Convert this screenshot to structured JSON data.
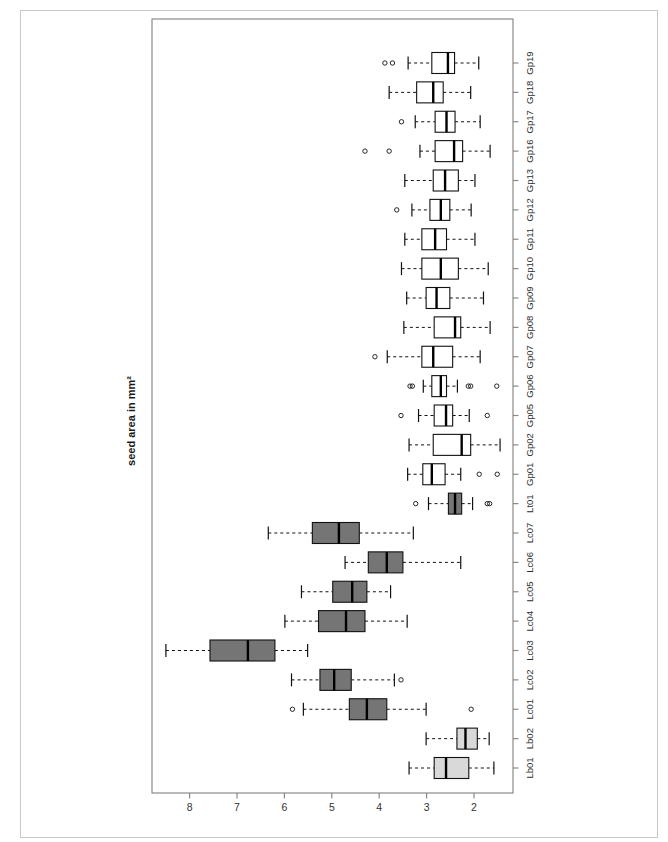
{
  "chart_data": {
    "type": "bar",
    "subtype": "boxplot",
    "orientation": "rotated-90 (categories on right, values on bottom, high values left)",
    "title": "",
    "value_axis": {
      "label": "seed area in mm²",
      "ticks": [
        8,
        7,
        6,
        5,
        4,
        3,
        2
      ],
      "range_left_to_right": [
        8.8,
        1.2
      ]
    },
    "legend": "none",
    "grid": "off",
    "group_colors": {
      "Gp": "#ffffff",
      "Lc": "#757575",
      "Lt": "#757575",
      "Lb": "#d9d9d9"
    },
    "frame_color": "#8a8a8a",
    "line_color": "#111111",
    "categories_top_to_bottom": [
      {
        "label": "Gp19",
        "group": "Gp",
        "low": 1.9,
        "q1": 2.41,
        "median": 2.55,
        "q3": 2.89,
        "high": 3.39,
        "outliers": [
          3.72,
          3.88
        ]
      },
      {
        "label": "Gp18",
        "group": "Gp",
        "low": 2.07,
        "q1": 2.65,
        "median": 2.86,
        "q3": 3.21,
        "high": 3.79,
        "outliers": []
      },
      {
        "label": "Gp17",
        "group": "Gp",
        "low": 1.87,
        "q1": 2.4,
        "median": 2.58,
        "q3": 2.82,
        "high": 3.24,
        "outliers": [
          3.53
        ]
      },
      {
        "label": "Gp16",
        "group": "Gp",
        "low": 1.66,
        "q1": 2.24,
        "median": 2.42,
        "q3": 2.82,
        "high": 3.14,
        "outliers": [
          3.79,
          4.3
        ]
      },
      {
        "label": "Gp13",
        "group": "Gp",
        "low": 1.98,
        "q1": 2.33,
        "median": 2.61,
        "q3": 2.86,
        "high": 3.46,
        "outliers": []
      },
      {
        "label": "Gp12",
        "group": "Gp",
        "low": 2.06,
        "q1": 2.51,
        "median": 2.7,
        "q3": 2.93,
        "high": 3.31,
        "outliers": [
          3.63
        ]
      },
      {
        "label": "Gp11",
        "group": "Gp",
        "low": 1.98,
        "q1": 2.58,
        "median": 2.82,
        "q3": 3.1,
        "high": 3.46,
        "outliers": []
      },
      {
        "label": "Gp10",
        "group": "Gp",
        "low": 1.7,
        "q1": 2.33,
        "median": 2.7,
        "q3": 3.1,
        "high": 3.53,
        "outliers": []
      },
      {
        "label": "Gp09",
        "group": "Gp",
        "low": 1.8,
        "q1": 2.51,
        "median": 2.79,
        "q3": 3.01,
        "high": 3.42,
        "outliers": []
      },
      {
        "label": "Gp08",
        "group": "Gp",
        "low": 1.66,
        "q1": 2.28,
        "median": 2.4,
        "q3": 2.84,
        "high": 3.48,
        "outliers": []
      },
      {
        "label": "Gp07",
        "group": "Gp",
        "low": 1.87,
        "q1": 2.45,
        "median": 2.86,
        "q3": 3.1,
        "high": 3.83,
        "outliers": [
          4.09
        ]
      },
      {
        "label": "Gp06",
        "group": "Gp",
        "low": 2.35,
        "q1": 2.58,
        "median": 2.7,
        "q3": 2.89,
        "high": 3.07,
        "outliers": [
          3.35,
          3.3,
          2.12,
          2.07,
          1.52
        ]
      },
      {
        "label": "Gp05",
        "group": "Gp",
        "low": 2.1,
        "q1": 2.45,
        "median": 2.59,
        "q3": 2.84,
        "high": 3.17,
        "outliers": [
          3.54,
          1.72
        ]
      },
      {
        "label": "Gp02",
        "group": "Gp",
        "low": 1.45,
        "q1": 2.07,
        "median": 2.26,
        "q3": 2.86,
        "high": 3.37,
        "outliers": []
      },
      {
        "label": "Gp01",
        "group": "Gp",
        "low": 2.28,
        "q1": 2.61,
        "median": 2.89,
        "q3": 3.08,
        "high": 3.4,
        "outliers": [
          1.89,
          1.51
        ]
      },
      {
        "label": "Lt01",
        "group": "Lt",
        "low": 2.03,
        "q1": 2.26,
        "median": 2.4,
        "q3": 2.54,
        "high": 2.96,
        "outliers": [
          3.23,
          1.72,
          1.67
        ]
      },
      {
        "label": "Lc07",
        "group": "Lc",
        "low": 3.28,
        "q1": 4.42,
        "median": 4.85,
        "q3": 5.41,
        "high": 6.34,
        "outliers": []
      },
      {
        "label": "Lc06",
        "group": "Lc",
        "low": 2.28,
        "q1": 3.5,
        "median": 3.84,
        "q3": 4.23,
        "high": 4.72,
        "outliers": []
      },
      {
        "label": "Lc05",
        "group": "Lc",
        "low": 3.76,
        "q1": 4.26,
        "median": 4.57,
        "q3": 4.98,
        "high": 5.64,
        "outliers": []
      },
      {
        "label": "Lc04",
        "group": "Lc",
        "low": 3.41,
        "q1": 4.3,
        "median": 4.7,
        "q3": 5.28,
        "high": 5.99,
        "outliers": []
      },
      {
        "label": "Lc03",
        "group": "Lc",
        "low": 5.51,
        "q1": 6.2,
        "median": 6.77,
        "q3": 7.57,
        "high": 8.5,
        "outliers": []
      },
      {
        "label": "Lc02",
        "group": "Lc",
        "low": 3.68,
        "q1": 4.59,
        "median": 4.95,
        "q3": 5.25,
        "high": 5.85,
        "outliers": [
          3.54
        ]
      },
      {
        "label": "Lc01",
        "group": "Lc",
        "low": 3.01,
        "q1": 3.84,
        "median": 4.26,
        "q3": 4.63,
        "high": 5.6,
        "outliers": [
          5.83,
          2.06
        ]
      },
      {
        "label": "Lb02",
        "group": "Lb",
        "low": 1.68,
        "q1": 1.93,
        "median": 2.18,
        "q3": 2.36,
        "high": 3.01,
        "outliers": []
      },
      {
        "label": "Lb01",
        "group": "Lb",
        "low": 1.58,
        "q1": 2.11,
        "median": 2.59,
        "q3": 2.84,
        "high": 3.37,
        "outliers": []
      }
    ]
  }
}
